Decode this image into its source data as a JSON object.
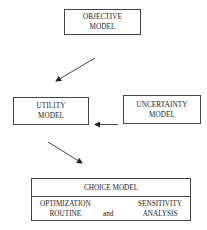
{
  "diagram": {
    "nodes": {
      "objective": {
        "line1": "OBJECTIVE",
        "line2": "MODEL"
      },
      "utility": {
        "line1": "UTILITY",
        "line2": "MODEL"
      },
      "uncertainty": {
        "line1": "UNCERTAINTY",
        "line2": "MODEL"
      },
      "choice": {
        "title": "CHOICE MODEL",
        "left": {
          "line1": "OPTIMIZATION",
          "line2": "ROUTINE"
        },
        "connector": "and",
        "right": {
          "line1": "SENSITIVITY",
          "line2": "ANALYSIS"
        }
      }
    },
    "edges": [
      {
        "from": "objective",
        "to": "utility"
      },
      {
        "from": "uncertainty",
        "to": "utility"
      },
      {
        "from": "utility",
        "to": "choice"
      }
    ]
  }
}
